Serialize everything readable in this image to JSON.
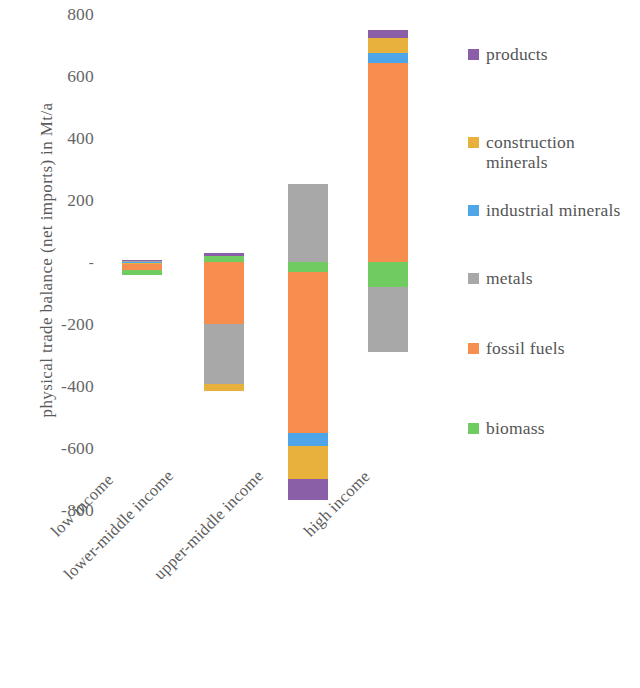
{
  "chart_data": {
    "type": "bar",
    "stacked": true,
    "title": "",
    "xlabel": "",
    "ylabel": "physical trade balance (net imports) in Mt/a",
    "categories": [
      "low income",
      "lower-middle income",
      "upper-middle income",
      "high income"
    ],
    "ylim": [
      -800,
      800
    ],
    "yticks": [
      800,
      600,
      400,
      200,
      0,
      -200,
      -400,
      -600,
      -800
    ],
    "ytick_labels": [
      "800",
      "600",
      "400",
      "200",
      "-",
      "-200",
      "-400",
      "-600",
      "-800"
    ],
    "grid": false,
    "legend_position": "right",
    "series": [
      {
        "name": "products",
        "color": "#8a5fa8",
        "values": [
          4,
          10,
          -68,
          26
        ]
      },
      {
        "name": "construction minerals",
        "color": "#e8b13c",
        "values": [
          -4,
          -20,
          -106,
          48
        ]
      },
      {
        "name": "industrial minerals",
        "color": "#4ea6e8",
        "values": [
          -2,
          -4,
          -42,
          32
        ]
      },
      {
        "name": "metals",
        "color": "#a8a8a8",
        "values": [
          -5,
          -195,
          251,
          -210
        ]
      },
      {
        "name": "fossil fuels",
        "color": "#f78d4e",
        "values": [
          -20,
          -200,
          -520,
          642
        ]
      },
      {
        "name": "biomass",
        "color": "#70cc60",
        "values": [
          -16,
          20,
          -32,
          -80
        ]
      }
    ]
  },
  "axis": {
    "y_title": "physical trade balance (net imports) in Mt/a",
    "ticks": [
      {
        "label": "800",
        "value": 800
      },
      {
        "label": "600",
        "value": 600
      },
      {
        "label": "400",
        "value": 400
      },
      {
        "label": "200",
        "value": 200
      },
      {
        "label": "-",
        "value": 0
      },
      {
        "label": "-200",
        "value": -200
      },
      {
        "label": "-400",
        "value": -400
      },
      {
        "label": "-600",
        "value": -600
      },
      {
        "label": "-800",
        "value": -800
      }
    ],
    "categories": [
      {
        "label": "low income"
      },
      {
        "label": "lower-middle income"
      },
      {
        "label": "upper-middle income"
      },
      {
        "label": "high income"
      }
    ]
  },
  "legend": {
    "items": [
      {
        "label": "products",
        "color": "#8a5fa8"
      },
      {
        "label": "construction minerals",
        "color": "#e8b13c"
      },
      {
        "label": "industrial minerals",
        "color": "#4ea6e8"
      },
      {
        "label": "metals",
        "color": "#a8a8a8"
      },
      {
        "label": "fossil fuels",
        "color": "#f78d4e"
      },
      {
        "label": "biomass",
        "color": "#70cc60"
      }
    ]
  },
  "bars": {
    "low_income": {
      "name": "low income",
      "segments": [
        {
          "series": "products",
          "from": 8,
          "to": 4
        },
        {
          "series": "metals",
          "from": 4,
          "to": -1
        },
        {
          "series": "industrial minerals",
          "from": -1,
          "to": -3
        },
        {
          "series": "construction minerals",
          "from": -3,
          "to": -7
        },
        {
          "series": "fossil fuels",
          "from": -7,
          "to": -27
        },
        {
          "series": "biomass",
          "from": -27,
          "to": -43
        }
      ]
    },
    "lower_middle_income": {
      "name": "lower-middle income",
      "segments": [
        {
          "series": "products",
          "from": 30,
          "to": 20
        },
        {
          "series": "biomass",
          "from": 20,
          "to": 0
        },
        {
          "series": "fossil fuels",
          "from": 0,
          "to": -200
        },
        {
          "series": "metals",
          "from": -200,
          "to": -395
        },
        {
          "series": "construction minerals",
          "from": -395,
          "to": -415
        }
      ]
    },
    "upper_middle_income": {
      "name": "upper-middle income",
      "segments": [
        {
          "series": "metals",
          "from": 251,
          "to": 0
        },
        {
          "series": "biomass",
          "from": 0,
          "to": -32
        },
        {
          "series": "fossil fuels",
          "from": -32,
          "to": -552
        },
        {
          "series": "industrial minerals",
          "from": -552,
          "to": -594
        },
        {
          "series": "construction minerals",
          "from": -594,
          "to": -700
        },
        {
          "series": "products",
          "from": -700,
          "to": -768
        }
      ]
    },
    "high_income": {
      "name": "high income",
      "segments": [
        {
          "series": "products",
          "from": 748,
          "to": 722
        },
        {
          "series": "construction minerals",
          "from": 722,
          "to": 674
        },
        {
          "series": "industrial minerals",
          "from": 674,
          "to": 642
        },
        {
          "series": "fossil fuels",
          "from": 642,
          "to": 0
        },
        {
          "series": "biomass",
          "from": 0,
          "to": -80
        },
        {
          "series": "metals",
          "from": -80,
          "to": -290
        }
      ]
    }
  }
}
